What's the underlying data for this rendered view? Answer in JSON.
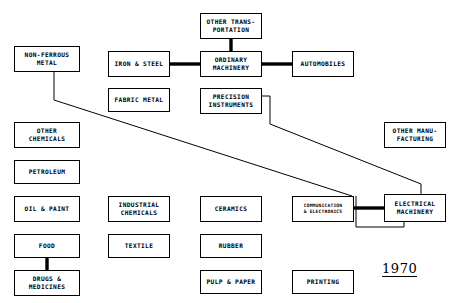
{
  "diagram": {
    "year_label": "1970",
    "canvas": {
      "width": 462,
      "height": 303,
      "background": "#ffffff"
    },
    "stroke_color": "#000000",
    "nodes": [
      {
        "id": "non-ferrous-metal",
        "lines": [
          "NON-FERROUS",
          "METAL"
        ],
        "x": 14,
        "y": 46,
        "w": 66,
        "h": 26,
        "size": "normal"
      },
      {
        "id": "other-transportation",
        "lines": [
          "OTHER TRANS-",
          "PORTATION"
        ],
        "x": 200,
        "y": 13,
        "w": 62,
        "h": 26,
        "size": "normal"
      },
      {
        "id": "iron-and-steel",
        "lines": [
          "IRON & STEEL"
        ],
        "x": 108,
        "y": 51,
        "w": 62,
        "h": 26,
        "size": "normal"
      },
      {
        "id": "ordinary-machinery",
        "lines": [
          "ORDINARY",
          "MACHINERY"
        ],
        "x": 200,
        "y": 51,
        "w": 62,
        "h": 26,
        "size": "normal"
      },
      {
        "id": "automobiles",
        "lines": [
          "AUTOMOBILES"
        ],
        "x": 292,
        "y": 51,
        "w": 62,
        "h": 26,
        "size": "normal"
      },
      {
        "id": "fabric-metal",
        "lines": [
          "FABRIC METAL"
        ],
        "x": 108,
        "y": 88,
        "w": 62,
        "h": 24,
        "size": "normal"
      },
      {
        "id": "precision-instruments",
        "lines": [
          "PRECISION",
          "INSTRUMENTS"
        ],
        "x": 200,
        "y": 88,
        "w": 62,
        "h": 26,
        "size": "normal"
      },
      {
        "id": "other-chemicals",
        "lines": [
          "OTHER",
          "CHEMICALS"
        ],
        "x": 14,
        "y": 122,
        "w": 66,
        "h": 26,
        "size": "normal"
      },
      {
        "id": "other-manufacturing",
        "lines": [
          "OTHER MANU-",
          "FACTURING"
        ],
        "x": 384,
        "y": 122,
        "w": 62,
        "h": 26,
        "size": "normal"
      },
      {
        "id": "petroleum",
        "lines": [
          "PETROLEUM"
        ],
        "x": 14,
        "y": 160,
        "w": 66,
        "h": 24,
        "size": "normal"
      },
      {
        "id": "oil-and-paint",
        "lines": [
          "OIL & PAINT"
        ],
        "x": 14,
        "y": 196,
        "w": 66,
        "h": 26,
        "size": "normal"
      },
      {
        "id": "industrial-chemicals",
        "lines": [
          "INDUSTRIAL",
          "CHEMICALS"
        ],
        "x": 108,
        "y": 196,
        "w": 62,
        "h": 26,
        "size": "normal"
      },
      {
        "id": "ceramics",
        "lines": [
          "CERAMICS"
        ],
        "x": 200,
        "y": 196,
        "w": 62,
        "h": 26,
        "size": "normal"
      },
      {
        "id": "communication-electronics",
        "lines": [
          "COMMUNICATION",
          "& ELECTRONICS"
        ],
        "x": 292,
        "y": 196,
        "w": 62,
        "h": 26,
        "size": "small"
      },
      {
        "id": "electrical-machinery",
        "lines": [
          "ELECTRICAL",
          "MACHINERY"
        ],
        "x": 384,
        "y": 194,
        "w": 62,
        "h": 28,
        "size": "normal"
      },
      {
        "id": "food",
        "lines": [
          "FOOD"
        ],
        "x": 14,
        "y": 234,
        "w": 66,
        "h": 24,
        "size": "normal"
      },
      {
        "id": "textile",
        "lines": [
          "TEXTILE"
        ],
        "x": 108,
        "y": 234,
        "w": 62,
        "h": 24,
        "size": "normal"
      },
      {
        "id": "rubber",
        "lines": [
          "RUBBER"
        ],
        "x": 200,
        "y": 234,
        "w": 62,
        "h": 24,
        "size": "normal"
      },
      {
        "id": "drugs-and-medicines",
        "lines": [
          "DRUGS &",
          "MEDICINES"
        ],
        "x": 14,
        "y": 270,
        "w": 66,
        "h": 26,
        "size": "normal"
      },
      {
        "id": "pulp-and-paper",
        "lines": [
          "PULP & PAPER"
        ],
        "x": 200,
        "y": 270,
        "w": 62,
        "h": 24,
        "size": "normal"
      },
      {
        "id": "printing",
        "lines": [
          "PRINTING"
        ],
        "x": 292,
        "y": 270,
        "w": 62,
        "h": 24,
        "size": "normal"
      }
    ],
    "links": [
      {
        "id": "link-other-transportation-ordinary-machinery",
        "from": "other-transportation",
        "to": "ordinary-machinery",
        "weight": "thick",
        "path": "M 231,39 L 231,51"
      },
      {
        "id": "link-iron-and-steel-ordinary-machinery",
        "from": "iron-and-steel",
        "to": "ordinary-machinery",
        "weight": "thick",
        "path": "M 170,64 L 200,64"
      },
      {
        "id": "link-ordinary-machinery-automobiles",
        "from": "ordinary-machinery",
        "to": "automobiles",
        "weight": "thick",
        "path": "M 262,64 L 292,64"
      },
      {
        "id": "link-food-drugs-and-medicines",
        "from": "food",
        "to": "drugs-and-medicines",
        "weight": "thick",
        "path": "M 47,258 L 47,270"
      },
      {
        "id": "link-communication-electronics-electrical-machinery",
        "from": "communication-electronics",
        "to": "electrical-machinery",
        "weight": "thick",
        "path": "M 354,208 L 384,208"
      },
      {
        "id": "link-non-ferrous-metal-communication-electronics",
        "from": "non-ferrous-metal",
        "to": "communication-electronics",
        "weight": "thin",
        "path": "M 54,72 L 54,100 L 352,196"
      },
      {
        "id": "link-precision-instruments-electrical-machinery",
        "from": "precision-instruments",
        "to": "electrical-machinery",
        "weight": "thin",
        "path": "M 262,96 L 270,96 L 270,124 L 421,184 L 421,194"
      },
      {
        "id": "link-electrical-machinery-communication-electronics-return",
        "from": "electrical-machinery",
        "to": "communication-electronics",
        "weight": "thin",
        "path": "M 404,222 L 404,227 L 356,227 L 356,196"
      }
    ]
  }
}
